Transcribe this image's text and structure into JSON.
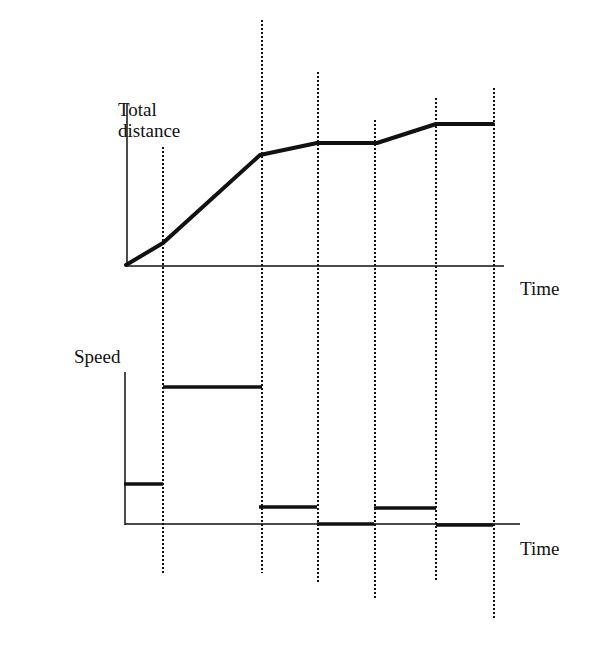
{
  "chart_data": [
    {
      "type": "line",
      "title": "",
      "ylabel": "Total distance",
      "xlabel": "Time",
      "grid": false,
      "legend": null,
      "x": [
        0,
        1,
        2,
        3,
        4,
        5,
        6
      ],
      "x_pixels": [
        126,
        163,
        260,
        317,
        377,
        436,
        493
      ],
      "values": [
        0,
        0.15,
        0.78,
        0.87,
        0.87,
        1.0,
        1.0
      ],
      "y_pixels": [
        265,
        243,
        155,
        143,
        143,
        124,
        124
      ],
      "notes": "Piecewise-linear distance-time graph: slow rise, steep rise, slow rise, flat, slow rise, flat"
    },
    {
      "type": "step",
      "title": "",
      "ylabel": "Speed",
      "xlabel": "Time",
      "grid": false,
      "legend": null,
      "segments": [
        {
          "x0": 0,
          "x1": 1,
          "speed": 0.15
        },
        {
          "x0": 1,
          "x1": 2,
          "speed": 0.6
        },
        {
          "x0": 2,
          "x1": 3,
          "speed": 0.05
        },
        {
          "x0": 3,
          "x1": 4,
          "speed": 0.0
        },
        {
          "x0": 4,
          "x1": 5,
          "speed": 0.05
        },
        {
          "x0": 5,
          "x1": 6,
          "speed": 0.0
        }
      ],
      "segment_pixels": [
        {
          "x0": 124,
          "x1": 163,
          "y": 484
        },
        {
          "x0": 163,
          "x1": 262,
          "y": 387
        },
        {
          "x0": 259,
          "x1": 317,
          "y": 507
        },
        {
          "x0": 317,
          "x1": 374,
          "y": 524
        },
        {
          "x0": 374,
          "x1": 436,
          "y": 508
        },
        {
          "x0": 436,
          "x1": 493,
          "y": 525
        }
      ]
    }
  ],
  "labels": {
    "distance_axis": [
      "Total",
      "distance"
    ],
    "distance_time": "Time",
    "speed_axis": "Speed",
    "speed_time": "Time"
  },
  "guides": [
    {
      "x": 163,
      "y0": 147,
      "y1": 575
    },
    {
      "x": 262,
      "y0": 20,
      "y1": 573
    },
    {
      "x": 318,
      "y0": 72,
      "y1": 584
    },
    {
      "x": 375,
      "y0": 120,
      "y1": 600
    },
    {
      "x": 436,
      "y0": 98,
      "y1": 582
    },
    {
      "x": 494,
      "y0": 88,
      "y1": 620
    }
  ],
  "colors": {
    "ink": "#111111",
    "background": "#ffffff"
  }
}
